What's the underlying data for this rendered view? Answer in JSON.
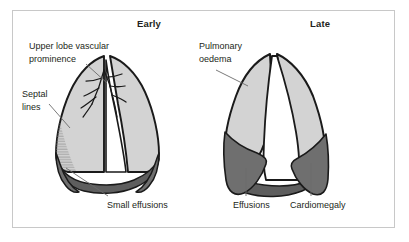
{
  "figure": {
    "panels": [
      {
        "id": "early",
        "title": "Early"
      },
      {
        "id": "late",
        "title": "Late"
      }
    ],
    "annotations": {
      "upper_lobe": "Upper lobe vascular\nprominence",
      "septal_lines": "Septal\nlines",
      "small_effusions": "Small effusions",
      "pulmonary_oedema": "Pulmonary\noedema",
      "effusions": "Effusions",
      "cardiomegaly": "Cardiomegaly"
    },
    "colors": {
      "lung_fill": "#d3d3d3",
      "effusion_fill": "#6f6f6f",
      "heart_fill": "#ffffff",
      "outline": "#1a1a1a",
      "leader_line": "#6b6b6b",
      "text": "#231f20",
      "frame_border": "#c8c8c8",
      "background": "#ffffff"
    }
  }
}
